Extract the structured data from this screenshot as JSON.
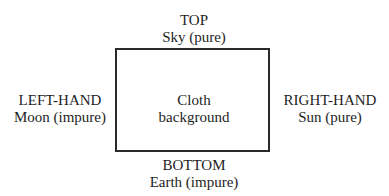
{
  "diagram": {
    "top": {
      "title": "TOP",
      "subtitle": "Sky (pure)"
    },
    "left": {
      "title": "LEFT-HAND",
      "subtitle": "Moon (impure)"
    },
    "center": {
      "line1": "Cloth",
      "line2": "background"
    },
    "right": {
      "title": "RIGHT-HAND",
      "subtitle": "Sun (pure)"
    },
    "bottom": {
      "title": "BOTTOM",
      "subtitle": "Earth (impure)"
    }
  }
}
